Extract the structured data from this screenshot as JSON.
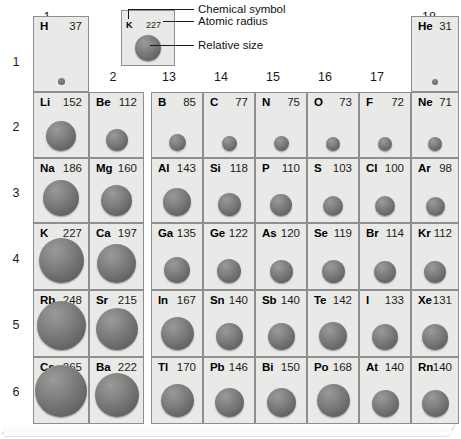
{
  "figure": {
    "kind": "periodic-table-atomic-radii",
    "units_note": ""
  },
  "legend": {
    "example_symbol": "K",
    "example_radius": "227",
    "callouts": [
      {
        "key": "chemical_symbol",
        "label": "Chemical symbol"
      },
      {
        "key": "atomic_radius",
        "label": "Atomic radius"
      },
      {
        "key": "relative_size",
        "label": "Relative size"
      }
    ]
  },
  "groups": [
    {
      "id": "g1",
      "label": "1",
      "x": 33,
      "y": 10
    },
    {
      "id": "g2",
      "label": "2",
      "x": 99,
      "y": 70
    },
    {
      "id": "g13",
      "label": "13",
      "x": 155,
      "y": 70
    },
    {
      "id": "g14",
      "label": "14",
      "x": 207,
      "y": 70
    },
    {
      "id": "g15",
      "label": "15",
      "x": 259,
      "y": 70
    },
    {
      "id": "g16",
      "label": "16",
      "x": 311,
      "y": 70
    },
    {
      "id": "g17",
      "label": "17",
      "x": 363,
      "y": 70
    },
    {
      "id": "g18",
      "label": "18",
      "x": 415,
      "y": 10
    }
  ],
  "periods": [
    {
      "label": "1",
      "y": 55
    },
    {
      "label": "2",
      "y": 120
    },
    {
      "label": "3",
      "y": 186
    },
    {
      "label": "4",
      "y": 252
    },
    {
      "label": "5",
      "y": 318
    },
    {
      "label": "6",
      "y": 385
    }
  ],
  "chart_data": {
    "type": "table",
    "value_name": "atomic radius",
    "categories": [
      "1",
      "2",
      "13",
      "14",
      "15",
      "16",
      "17",
      "18"
    ],
    "elements": [
      {
        "symbol": "H",
        "radius": 37,
        "group": 1,
        "period": 1
      },
      {
        "symbol": "He",
        "radius": 31,
        "group": 18,
        "period": 1
      },
      {
        "symbol": "Li",
        "radius": 152,
        "group": 1,
        "period": 2
      },
      {
        "symbol": "Be",
        "radius": 112,
        "group": 2,
        "period": 2
      },
      {
        "symbol": "B",
        "radius": 85,
        "group": 13,
        "period": 2
      },
      {
        "symbol": "C",
        "radius": 77,
        "group": 14,
        "period": 2
      },
      {
        "symbol": "N",
        "radius": 75,
        "group": 15,
        "period": 2
      },
      {
        "symbol": "O",
        "radius": 73,
        "group": 16,
        "period": 2
      },
      {
        "symbol": "F",
        "radius": 72,
        "group": 17,
        "period": 2
      },
      {
        "symbol": "Ne",
        "radius": 71,
        "group": 18,
        "period": 2
      },
      {
        "symbol": "Na",
        "radius": 186,
        "group": 1,
        "period": 3
      },
      {
        "symbol": "Mg",
        "radius": 160,
        "group": 2,
        "period": 3
      },
      {
        "symbol": "Al",
        "radius": 143,
        "group": 13,
        "period": 3
      },
      {
        "symbol": "Si",
        "radius": 118,
        "group": 14,
        "period": 3
      },
      {
        "symbol": "P",
        "radius": 110,
        "group": 15,
        "period": 3
      },
      {
        "symbol": "S",
        "radius": 103,
        "group": 16,
        "period": 3
      },
      {
        "symbol": "Cl",
        "radius": 100,
        "group": 17,
        "period": 3
      },
      {
        "symbol": "Ar",
        "radius": 98,
        "group": 18,
        "period": 3
      },
      {
        "symbol": "K",
        "radius": 227,
        "group": 1,
        "period": 4
      },
      {
        "symbol": "Ca",
        "radius": 197,
        "group": 2,
        "period": 4
      },
      {
        "symbol": "Ga",
        "radius": 135,
        "group": 13,
        "period": 4
      },
      {
        "symbol": "Ge",
        "radius": 122,
        "group": 14,
        "period": 4
      },
      {
        "symbol": "As",
        "radius": 120,
        "group": 15,
        "period": 4
      },
      {
        "symbol": "Se",
        "radius": 119,
        "group": 16,
        "period": 4
      },
      {
        "symbol": "Br",
        "radius": 114,
        "group": 17,
        "period": 4
      },
      {
        "symbol": "Kr",
        "radius": 112,
        "group": 18,
        "period": 4
      },
      {
        "symbol": "Rb",
        "radius": 248,
        "group": 1,
        "period": 5
      },
      {
        "symbol": "Sr",
        "radius": 215,
        "group": 2,
        "period": 5
      },
      {
        "symbol": "In",
        "radius": 167,
        "group": 13,
        "period": 5
      },
      {
        "symbol": "Sn",
        "radius": 140,
        "group": 14,
        "period": 5
      },
      {
        "symbol": "Sb",
        "radius": 140,
        "group": 15,
        "period": 5
      },
      {
        "symbol": "Te",
        "radius": 142,
        "group": 16,
        "period": 5
      },
      {
        "symbol": "I",
        "radius": 133,
        "group": 17,
        "period": 5
      },
      {
        "symbol": "Xe",
        "radius": 131,
        "group": 18,
        "period": 5
      },
      {
        "symbol": "Cs",
        "radius": 265,
        "group": 1,
        "period": 6
      },
      {
        "symbol": "Ba",
        "radius": 222,
        "group": 2,
        "period": 6
      },
      {
        "symbol": "Tl",
        "radius": 170,
        "group": 13,
        "period": 6
      },
      {
        "symbol": "Pb",
        "radius": 146,
        "group": 14,
        "period": 6
      },
      {
        "symbol": "Bi",
        "radius": 150,
        "group": 15,
        "period": 6
      },
      {
        "symbol": "Po",
        "radius": 168,
        "group": 16,
        "period": 6
      },
      {
        "symbol": "At",
        "radius": 140,
        "group": 17,
        "period": 6
      },
      {
        "symbol": "Rn",
        "radius": 140,
        "group": 18,
        "period": 6
      }
    ]
  },
  "colors": {
    "cell_background": "#e9e9e7",
    "cell_border": "#8e8e8e",
    "sphere_light": "#9a9a98",
    "sphere_dark": "#575755",
    "text": "#000000",
    "page_background": "#ffffff"
  }
}
